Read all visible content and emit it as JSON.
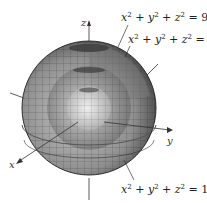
{
  "figure": {
    "axes": {
      "x": "x",
      "y": "y",
      "z": "z"
    },
    "labels": [
      {
        "id": "outer",
        "lhs_terms": [
          "x",
          "y",
          "z"
        ],
        "exponent": "2",
        "rhs": "9"
      },
      {
        "id": "middle",
        "lhs_terms": [
          "x",
          "y",
          "z"
        ],
        "exponent": "2",
        "rhs": "4"
      },
      {
        "id": "inner",
        "lhs_terms": [
          "x",
          "y",
          "z"
        ],
        "exponent": "2",
        "rhs": "1"
      }
    ],
    "colors": {
      "sphere_light": "#d8d8d8",
      "sphere_mid": "#9a9a9a",
      "sphere_dark": "#4a4a4a",
      "grid": "#222222",
      "axis": "#333333"
    }
  }
}
